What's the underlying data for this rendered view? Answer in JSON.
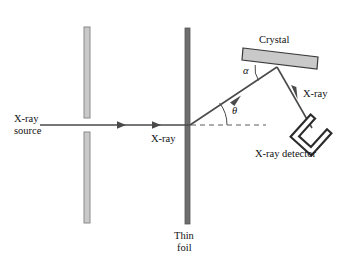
{
  "figure": {
    "background_color": "#ffffff",
    "line_color": "#3d3d3d",
    "foil_color": "#6e6e6e",
    "slit_fill_color": "#c9c9c9",
    "crystal_fill_color": "#c9c9c9",
    "detector_color": "#2b2b2b"
  },
  "labels": {
    "source_line1": "X-ray",
    "source_line2": "source",
    "beam_incident": "X-ray",
    "foil_line1": "Thin",
    "foil_line2": "foil",
    "crystal": "Crystal",
    "beam_diffracted": "X-ray",
    "detector": "X-ray detector",
    "angle_theta": "θ",
    "angle_alpha": "α"
  },
  "components": {
    "collimator": {
      "name": "collimator slits",
      "slit_upper": {
        "x": 84,
        "y": 27,
        "width": 6,
        "height": 91
      },
      "slit_lower": {
        "x": 84,
        "y": 132,
        "width": 6,
        "height": 91
      }
    },
    "thin_foil": {
      "x": 185,
      "y": 28,
      "width": 5,
      "height": 196
    },
    "crystal": {
      "points": "243,48 318,57 317,69 242,60",
      "tilt_degrees": 7
    },
    "detector": {
      "center_x": 311,
      "center_y": 135,
      "rotation_degrees": 42
    }
  },
  "rays": {
    "incident_beam": {
      "x1": 40,
      "y1": 125,
      "x2": 190,
      "y2": 125,
      "arrow_positions": [
        123,
        158
      ]
    },
    "diffracted_up": {
      "x1": 190,
      "y1": 125,
      "x2": 277,
      "y2": 67
    },
    "diffracted_down": {
      "x1": 277,
      "y1": 67,
      "x2": 312,
      "y2": 128
    },
    "reference_dashed": {
      "x1": 191,
      "y1": 125,
      "x2": 266,
      "y2": 125
    }
  },
  "angles": {
    "theta_value_label": "θ",
    "theta_arc_radius": 36,
    "alpha_value_label": "α",
    "alpha_arc_radius": 22
  }
}
